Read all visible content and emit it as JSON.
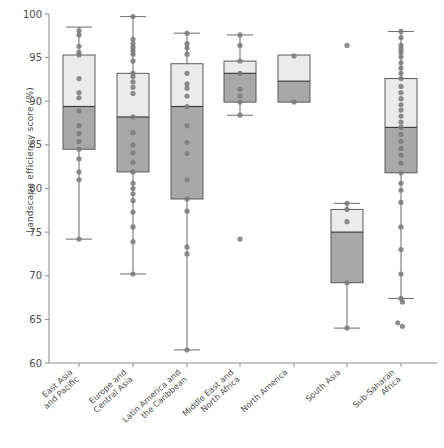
{
  "chart_data": {
    "type": "box",
    "title": "",
    "xlabel": "",
    "ylabel": "Landscape efficiency score (%)",
    "ylim": [
      60,
      100
    ],
    "yticks": [
      60,
      65,
      70,
      75,
      80,
      85,
      90,
      95,
      100
    ],
    "ytick_labels": [
      "60",
      "65",
      "70",
      "75",
      "80",
      "85",
      "90",
      "95",
      "100"
    ],
    "grid": false,
    "legend": "none",
    "categories": [
      "East Asia\nand Pacific",
      "Europe and\nCentral Asia",
      "Latin America and\nthe Caribbean",
      "Middle East and\nNorth Africa",
      "North America",
      "South Asia",
      "Sub-Saharan\nAfrica"
    ],
    "boxes": [
      {
        "name": "East Asia and Pacific",
        "whisker_low": 74.2,
        "q1": 84.5,
        "median": 89.4,
        "q3": 95.3,
        "whisker_high": 98.5,
        "outliers": [],
        "points": [
          98.1,
          97.6,
          96.3,
          95.6,
          95.3,
          92.6,
          91.0,
          90.4,
          88.9,
          87.2,
          86.3,
          85.4,
          84.5,
          83.4,
          81.9,
          81.0,
          74.2
        ]
      },
      {
        "name": "Europe and Central Asia",
        "whisker_low": 70.2,
        "q1": 81.9,
        "median": 88.2,
        "q3": 93.2,
        "whisker_high": 99.7,
        "outliers": [],
        "points": [
          99.7,
          97.1,
          96.6,
          96.2,
          95.8,
          95.4,
          94.6,
          93.2,
          92.8,
          92.2,
          91.6,
          90.9,
          88.2,
          86.4,
          85.0,
          84.1,
          83.0,
          81.9,
          80.6,
          80.0,
          79.4,
          78.6,
          77.3,
          75.6,
          73.9,
          70.2
        ]
      },
      {
        "name": "Latin America and the Caribbean",
        "whisker_low": 61.5,
        "q1": 78.8,
        "median": 89.4,
        "q3": 94.3,
        "whisker_high": 97.8,
        "outliers": [],
        "points": [
          97.8,
          96.6,
          96.1,
          95.4,
          93.2,
          92.0,
          91.5,
          90.6,
          89.4,
          87.2,
          85.3,
          84.0,
          81.0,
          78.8,
          77.4,
          73.3,
          72.5,
          61.5
        ]
      },
      {
        "name": "Middle East and North Africa",
        "whisker_low": 88.4,
        "q1": 89.9,
        "median": 93.2,
        "q3": 94.6,
        "whisker_high": 97.6,
        "outliers": [
          74.2
        ],
        "points": [
          97.6,
          96.4,
          94.6,
          93.2,
          91.4,
          90.6,
          89.9,
          88.4
        ]
      },
      {
        "name": "North America",
        "whisker_low": 89.9,
        "q1": 89.9,
        "median": 92.3,
        "q3": 95.3,
        "whisker_high": 95.3,
        "outliers": [],
        "points": [
          95.2,
          89.9
        ]
      },
      {
        "name": "South Asia",
        "whisker_low": 64.0,
        "q1": 69.2,
        "median": 75.0,
        "q3": 77.6,
        "whisker_high": 78.3,
        "outliers": [
          96.4
        ],
        "points": [
          78.3,
          77.6,
          76.2,
          69.2,
          64.0
        ]
      },
      {
        "name": "Sub-Saharan Africa",
        "whisker_low": 67.4,
        "q1": 81.8,
        "median": 87.0,
        "q3": 92.6,
        "whisker_high": 98.0,
        "outliers": [
          67.0,
          64.6,
          64.2
        ],
        "points": [
          98.0,
          97.3,
          96.4,
          96.0,
          95.6,
          95.1,
          94.4,
          93.8,
          93.2,
          92.6,
          91.7,
          91.0,
          90.3,
          89.6,
          89.0,
          88.3,
          87.6,
          87.0,
          86.2,
          85.4,
          84.6,
          83.8,
          82.9,
          81.8,
          80.6,
          79.8,
          78.4,
          75.6,
          73.0,
          70.2,
          67.4
        ]
      }
    ],
    "colors": {
      "box_upper_fill": "#ebebeb",
      "box_lower_fill": "#a8a8a8",
      "box_edge": "#5a5a5a",
      "point": "#7a7a7a",
      "axis": "#8c8c8c",
      "text": "#4d4d4d"
    }
  }
}
